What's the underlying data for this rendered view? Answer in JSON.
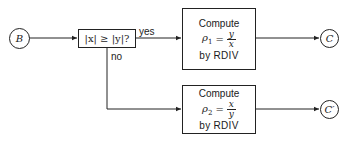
{
  "diagram": {
    "entry": {
      "label": "B"
    },
    "decision": {
      "label": "|x| ≥ |y|?",
      "yes_label": "yes",
      "no_label": "no"
    },
    "compute_top": {
      "title": "Compute",
      "var": "ρ",
      "subscript": "1",
      "equals": "=",
      "numerator": "y",
      "denominator": "x",
      "method": "by RDIV"
    },
    "compute_bottom": {
      "title": "Compute",
      "var": "ρ",
      "subscript": "2",
      "equals": "=",
      "numerator": "x",
      "denominator": "y",
      "method": "by RDIV"
    },
    "exit_top": {
      "label": "C"
    },
    "exit_bottom": {
      "label": "C′"
    },
    "colors": {
      "line": "#222222",
      "background": "#ffffff"
    }
  }
}
